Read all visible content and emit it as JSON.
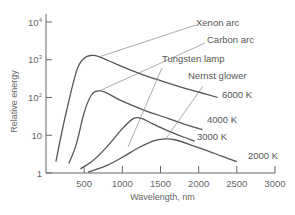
{
  "chart_data": {
    "type": "line",
    "title": "",
    "xlabel": "Wavelength, nm",
    "ylabel": "Relative energy",
    "xlim": [
      0,
      3000
    ],
    "ylim": [
      1,
      10000
    ],
    "yscale": "log",
    "grid": false,
    "x_ticks": [
      500,
      1000,
      1500,
      2000,
      2500,
      3000
    ],
    "x_tick_labels": [
      "500",
      "1000",
      "1500",
      "2000",
      "2500",
      "3000"
    ],
    "y_ticks": [
      1,
      10,
      100,
      1000,
      10000
    ],
    "y_tick_labels": [
      {
        "base": "1",
        "exp": ""
      },
      {
        "base": "10",
        "exp": ""
      },
      {
        "base": "10",
        "exp": "2"
      },
      {
        "base": "10",
        "exp": "3"
      },
      {
        "base": "10",
        "exp": "4"
      }
    ],
    "series": [
      {
        "name": "Xenon arc",
        "temperature_label": "6000 K",
        "x": [
          130,
          250,
          400,
          500,
          600,
          700,
          900,
          1200,
          1500,
          1800,
          2000,
          2250
        ],
        "y": [
          2,
          30,
          500,
          1100,
          1300,
          1200,
          800,
          450,
          280,
          180,
          140,
          100
        ]
      },
      {
        "name": "Carbon arc",
        "temperature_label": "4000 K",
        "x": [
          300,
          400,
          500,
          600,
          700,
          800,
          1000,
          1300,
          1600,
          1800,
          2050
        ],
        "y": [
          1.8,
          6,
          40,
          120,
          150,
          130,
          80,
          45,
          28,
          20,
          14
        ]
      },
      {
        "name": "Tungsten lamp",
        "temperature_label": "3000 K",
        "x": [
          450,
          600,
          800,
          1000,
          1150,
          1250,
          1400,
          1600,
          1800,
          1950
        ],
        "y": [
          1.3,
          2,
          5,
          15,
          28,
          28,
          20,
          13,
          9,
          7
        ]
      },
      {
        "name": "Nernst glower",
        "temperature_label": "2000 K",
        "x": [
          550,
          800,
          1000,
          1200,
          1400,
          1550,
          1700,
          1900,
          2100,
          2300,
          2500
        ],
        "y": [
          1.05,
          1.6,
          2.6,
          4.5,
          7,
          8,
          7.5,
          5.5,
          4,
          2.8,
          2
        ]
      }
    ]
  }
}
